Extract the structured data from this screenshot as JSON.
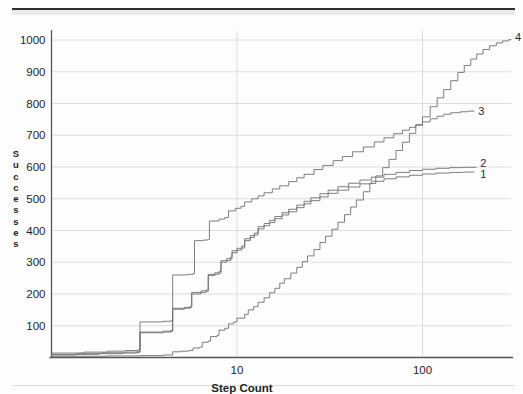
{
  "page": {
    "background_color": "#fdfdfd",
    "rule_color": "#2f2f2f"
  },
  "chart_data": {
    "type": "line",
    "title": "",
    "subtitle": "",
    "xlabel": "Step Count",
    "ylabel": "Successes",
    "ylabel_letters": [
      "S",
      "u",
      "c",
      "c",
      "e",
      "s",
      "s",
      "e",
      "s"
    ],
    "xscale": "log",
    "yscale": "linear",
    "xlim": [
      1.0,
      300.0
    ],
    "ylim": [
      0,
      1030
    ],
    "grid": true,
    "grid_color": "#dddddd",
    "axis_color": "#555555",
    "line_color": "#6f6f6f",
    "legend_position": "right-end-labels",
    "xticks": [
      10,
      100
    ],
    "xtick_labels": [
      "10",
      "100"
    ],
    "yticks": [
      100,
      200,
      300,
      400,
      500,
      600,
      700,
      800,
      900,
      1000
    ],
    "ytick_labels": [
      "100",
      "200",
      "300",
      "400",
      "500",
      "600",
      "700",
      "800",
      "900",
      "1000"
    ],
    "annotations": [
      {
        "text": "4",
        "x": 300,
        "y": 1010
      },
      {
        "text": "3",
        "x": 190,
        "y": 778
      },
      {
        "text": "2",
        "x": 195,
        "y": 612
      },
      {
        "text": "1",
        "x": 195,
        "y": 578
      }
    ],
    "series": [
      {
        "name": "1",
        "label": "1",
        "step": true,
        "points": [
          [
            1.0,
            8
          ],
          [
            1.35,
            10
          ],
          [
            1.8,
            12
          ],
          [
            2.4,
            14
          ],
          [
            2.9,
            16
          ],
          [
            3.0,
            78
          ],
          [
            4.0,
            80
          ],
          [
            4.4,
            82
          ],
          [
            4.5,
            152
          ],
          [
            5.2,
            155
          ],
          [
            5.6,
            158
          ],
          [
            5.7,
            200
          ],
          [
            6.4,
            205
          ],
          [
            6.8,
            208
          ],
          [
            7.0,
            258
          ],
          [
            7.6,
            262
          ],
          [
            8.0,
            266
          ],
          [
            8.2,
            300
          ],
          [
            8.8,
            305
          ],
          [
            9.2,
            310
          ],
          [
            9.4,
            330
          ],
          [
            10.0,
            338
          ],
          [
            10.6,
            345
          ],
          [
            11.0,
            368
          ],
          [
            11.8,
            378
          ],
          [
            12.4,
            386
          ],
          [
            13.0,
            405
          ],
          [
            14.0,
            415
          ],
          [
            15.0,
            425
          ],
          [
            16.0,
            437
          ],
          [
            17.5,
            449
          ],
          [
            19.0,
            459
          ],
          [
            21.0,
            472
          ],
          [
            23.0,
            484
          ],
          [
            25.0,
            494
          ],
          [
            28.0,
            506
          ],
          [
            31.0,
            517
          ],
          [
            35.0,
            527
          ],
          [
            40.0,
            537
          ],
          [
            46.0,
            547
          ],
          [
            53.0,
            555
          ],
          [
            62.0,
            563
          ],
          [
            72.0,
            569
          ],
          [
            85.0,
            574
          ],
          [
            100.0,
            578
          ],
          [
            118.0,
            581
          ],
          [
            140.0,
            583
          ],
          [
            165.0,
            584
          ],
          [
            190.0,
            585
          ]
        ]
      },
      {
        "name": "2",
        "label": "2",
        "step": true,
        "points": [
          [
            1.0,
            10
          ],
          [
            1.4,
            13
          ],
          [
            1.9,
            15
          ],
          [
            2.5,
            17
          ],
          [
            2.9,
            19
          ],
          [
            3.0,
            80
          ],
          [
            4.0,
            83
          ],
          [
            4.4,
            85
          ],
          [
            4.5,
            155
          ],
          [
            5.2,
            158
          ],
          [
            5.6,
            161
          ],
          [
            5.7,
            205
          ],
          [
            6.4,
            210
          ],
          [
            6.8,
            213
          ],
          [
            7.0,
            262
          ],
          [
            7.6,
            267
          ],
          [
            8.0,
            271
          ],
          [
            8.2,
            305
          ],
          [
            8.8,
            311
          ],
          [
            9.2,
            316
          ],
          [
            9.4,
            336
          ],
          [
            10.0,
            344
          ],
          [
            10.6,
            351
          ],
          [
            11.0,
            374
          ],
          [
            11.8,
            384
          ],
          [
            12.4,
            392
          ],
          [
            13.0,
            412
          ],
          [
            14.0,
            422
          ],
          [
            15.0,
            432
          ],
          [
            16.0,
            444
          ],
          [
            17.5,
            456
          ],
          [
            19.0,
            467
          ],
          [
            21.0,
            480
          ],
          [
            23.0,
            492
          ],
          [
            25.0,
            503
          ],
          [
            28.0,
            516
          ],
          [
            31.0,
            527
          ],
          [
            35.0,
            538
          ],
          [
            40.0,
            549
          ],
          [
            46.0,
            559
          ],
          [
            53.0,
            568
          ],
          [
            62.0,
            577
          ],
          [
            72.0,
            583
          ],
          [
            85.0,
            589
          ],
          [
            100.0,
            593
          ],
          [
            118.0,
            596
          ],
          [
            140.0,
            598
          ],
          [
            165.0,
            599
          ],
          [
            195.0,
            600
          ]
        ]
      },
      {
        "name": "3",
        "label": "3",
        "step": true,
        "points": [
          [
            1.0,
            14
          ],
          [
            1.5,
            17
          ],
          [
            2.0,
            20
          ],
          [
            2.5,
            22
          ],
          [
            2.9,
            24
          ],
          [
            3.0,
            112
          ],
          [
            4.0,
            114
          ],
          [
            4.4,
            116
          ],
          [
            4.5,
            260
          ],
          [
            5.4,
            262
          ],
          [
            5.8,
            264
          ],
          [
            5.9,
            368
          ],
          [
            6.6,
            370
          ],
          [
            7.0,
            372
          ],
          [
            7.1,
            430
          ],
          [
            8.0,
            436
          ],
          [
            8.6,
            441
          ],
          [
            9.0,
            462
          ],
          [
            9.8,
            470
          ],
          [
            10.5,
            476
          ],
          [
            11.0,
            490
          ],
          [
            12.0,
            500
          ],
          [
            13.0,
            509
          ],
          [
            14.0,
            519
          ],
          [
            15.5,
            531
          ],
          [
            17.0,
            541
          ],
          [
            19.0,
            554
          ],
          [
            21.0,
            566
          ],
          [
            23.0,
            577
          ],
          [
            26.0,
            592
          ],
          [
            29.0,
            605
          ],
          [
            33.0,
            620
          ],
          [
            37.0,
            633
          ],
          [
            42.0,
            648
          ],
          [
            48.0,
            663
          ],
          [
            55.0,
            679
          ],
          [
            62.0,
            692
          ],
          [
            70.0,
            705
          ],
          [
            78.0,
            716
          ],
          [
            85.0,
            725
          ],
          [
            92.0,
            733
          ],
          [
            100.0,
            742
          ],
          [
            110.0,
            752
          ],
          [
            120.0,
            760
          ],
          [
            130.0,
            766
          ],
          [
            142.0,
            771
          ],
          [
            160.0,
            774
          ],
          [
            175.0,
            776
          ],
          [
            190.0,
            777
          ]
        ]
      },
      {
        "name": "4",
        "label": "4",
        "step": true,
        "points": [
          [
            1.0,
            4
          ],
          [
            2.0,
            5
          ],
          [
            3.0,
            6
          ],
          [
            4.0,
            8
          ],
          [
            4.5,
            18
          ],
          [
            5.0,
            20
          ],
          [
            5.5,
            22
          ],
          [
            5.8,
            30
          ],
          [
            6.3,
            33
          ],
          [
            6.5,
            48
          ],
          [
            7.0,
            52
          ],
          [
            7.2,
            66
          ],
          [
            7.8,
            70
          ],
          [
            8.0,
            86
          ],
          [
            8.6,
            92
          ],
          [
            9.0,
            106
          ],
          [
            9.6,
            112
          ],
          [
            10.0,
            124
          ],
          [
            11.0,
            136
          ],
          [
            11.5,
            150
          ],
          [
            12.3,
            160
          ],
          [
            13.0,
            174
          ],
          [
            14.0,
            188
          ],
          [
            15.0,
            204
          ],
          [
            16.0,
            218
          ],
          [
            17.0,
            234
          ],
          [
            18.0,
            248
          ],
          [
            19.5,
            266
          ],
          [
            21.0,
            284
          ],
          [
            22.5,
            302
          ],
          [
            24.0,
            320
          ],
          [
            26.0,
            340
          ],
          [
            28.0,
            362
          ],
          [
            30.0,
            382
          ],
          [
            32.5,
            404
          ],
          [
            35.0,
            426
          ],
          [
            38.0,
            450
          ],
          [
            41.0,
            474
          ],
          [
            44.0,
            496
          ],
          [
            48.0,
            522
          ],
          [
            52.0,
            548
          ],
          [
            56.0,
            572
          ],
          [
            61.0,
            598
          ],
          [
            66.0,
            624
          ],
          [
            72.0,
            652
          ],
          [
            78.0,
            678
          ],
          [
            85.0,
            706
          ],
          [
            92.0,
            732
          ],
          [
            100.0,
            758
          ],
          [
            110.0,
            790
          ],
          [
            120.0,
            818
          ],
          [
            130.0,
            844
          ],
          [
            142.0,
            872
          ],
          [
            155.0,
            898
          ],
          [
            168.0,
            920
          ],
          [
            182.0,
            940
          ],
          [
            196.0,
            956
          ],
          [
            212.0,
            970
          ],
          [
            230.0,
            982
          ],
          [
            250.0,
            991
          ],
          [
            270.0,
            997
          ],
          [
            290.0,
            1001
          ],
          [
            300.0,
            1003
          ]
        ]
      }
    ]
  }
}
